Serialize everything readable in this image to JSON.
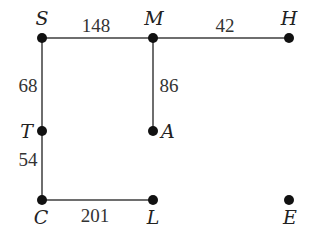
{
  "diagram": {
    "type": "weighted-graph",
    "nodes": [
      {
        "id": "S",
        "label": "S",
        "x": 42,
        "y": 38,
        "lx": 42,
        "ly": 25,
        "anchor": "middle"
      },
      {
        "id": "M",
        "label": "M",
        "x": 153,
        "y": 38,
        "lx": 154,
        "ly": 25,
        "anchor": "middle"
      },
      {
        "id": "H",
        "label": "H",
        "x": 289,
        "y": 38,
        "lx": 289,
        "ly": 25,
        "anchor": "middle"
      },
      {
        "id": "T",
        "label": "T",
        "x": 42,
        "y": 131,
        "lx": 30,
        "ly": 138,
        "anchor": "end"
      },
      {
        "id": "A",
        "label": "A",
        "x": 153,
        "y": 131,
        "lx": 162,
        "ly": 138,
        "anchor": "start"
      },
      {
        "id": "C",
        "label": "C",
        "x": 42,
        "y": 200,
        "lx": 41,
        "ly": 224,
        "anchor": "middle"
      },
      {
        "id": "L",
        "label": "L",
        "x": 153,
        "y": 200,
        "lx": 153,
        "ly": 224,
        "anchor": "middle"
      },
      {
        "id": "E",
        "label": "E",
        "x": 289,
        "y": 200,
        "lx": 290,
        "ly": 224,
        "anchor": "middle"
      }
    ],
    "edges": [
      {
        "from": "S",
        "to": "M",
        "weight": "148",
        "lx": 96,
        "ly": 32,
        "anchor": "middle"
      },
      {
        "from": "M",
        "to": "H",
        "weight": "42",
        "lx": 225,
        "ly": 32,
        "anchor": "middle"
      },
      {
        "from": "S",
        "to": "T",
        "weight": "68",
        "lx": 28,
        "ly": 92,
        "anchor": "middle"
      },
      {
        "from": "M",
        "to": "A",
        "weight": "86",
        "lx": 169,
        "ly": 92,
        "anchor": "middle"
      },
      {
        "from": "T",
        "to": "C",
        "weight": "54",
        "lx": 28,
        "ly": 166,
        "anchor": "middle"
      },
      {
        "from": "C",
        "to": "L",
        "weight": "201",
        "lx": 95,
        "ly": 222,
        "anchor": "middle"
      }
    ]
  },
  "labels": {
    "S": "S",
    "M": "M",
    "H": "H",
    "T": "T",
    "A": "A",
    "C": "C",
    "L": "L",
    "E": "E",
    "w_SM": "148",
    "w_MH": "42",
    "w_ST": "68",
    "w_MA": "86",
    "w_TC": "54",
    "w_CL": "201"
  }
}
